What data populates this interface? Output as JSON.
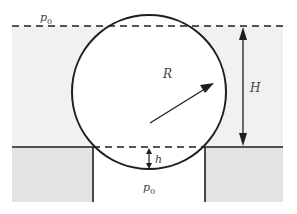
{
  "diagram": {
    "labels": {
      "p0_top": "p",
      "p0_top_sub": "0",
      "radius": "R",
      "height": "H",
      "gap": "h",
      "p0_bottom": "p",
      "p0_bottom_sub": "0"
    },
    "colors": {
      "upper_fluid": "#f1f1f1",
      "lower_wall": "#e3e3e3",
      "stroke": "#1e1e1e"
    }
  }
}
